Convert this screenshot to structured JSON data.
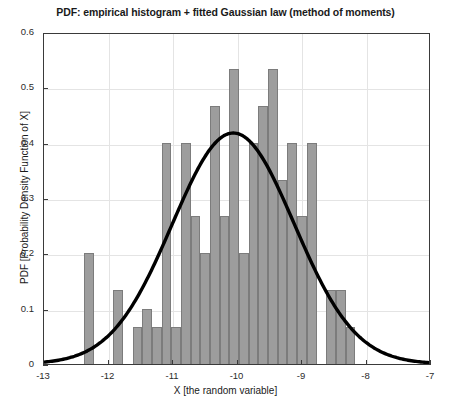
{
  "chart_data": {
    "type": "bar",
    "title": "PDF: empirical histogram + fitted Gaussian law (method of moments)",
    "xlabel": "X [the random variable]",
    "ylabel": "PDF [Probability Density Function of X]",
    "xlim": [
      -13,
      -7
    ],
    "ylim": [
      0,
      0.6
    ],
    "xticks": [
      -13,
      -12,
      -11,
      -10,
      -9,
      -8,
      -7
    ],
    "xticklabels": [
      "-13",
      "-12",
      "-11",
      "-10",
      "-9",
      "-8",
      "-7"
    ],
    "yticks": [
      0,
      0.1,
      0.2,
      0.3,
      0.4,
      0.5,
      0.6
    ],
    "yticklabels": [
      "0",
      "0.1",
      "0.2",
      "0.3",
      "0.4",
      "0.5",
      "0.6"
    ],
    "grid": true,
    "legend": null,
    "bar_color": "#9d9d9d",
    "bar_edge_color": "#7c7c7c",
    "curve_color": "#000000",
    "bin_width": 0.15,
    "bins": [
      {
        "center": -12.3,
        "value": 0.2
      },
      {
        "center": -11.85,
        "value": 0.133
      },
      {
        "center": -11.55,
        "value": 0.067
      },
      {
        "center": -11.4,
        "value": 0.1
      },
      {
        "center": -11.25,
        "value": 0.067
      },
      {
        "center": -11.1,
        "value": 0.4
      },
      {
        "center": -10.95,
        "value": 0.067
      },
      {
        "center": -10.8,
        "value": 0.4
      },
      {
        "center": -10.65,
        "value": 0.267
      },
      {
        "center": -10.5,
        "value": 0.2
      },
      {
        "center": -10.35,
        "value": 0.467
      },
      {
        "center": -10.2,
        "value": 0.267
      },
      {
        "center": -10.05,
        "value": 0.533
      },
      {
        "center": -9.9,
        "value": 0.2
      },
      {
        "center": -9.75,
        "value": 0.4
      },
      {
        "center": -9.6,
        "value": 0.467
      },
      {
        "center": -9.45,
        "value": 0.533
      },
      {
        "center": -9.3,
        "value": 0.333
      },
      {
        "center": -9.15,
        "value": 0.4
      },
      {
        "center": -9.0,
        "value": 0.267
      },
      {
        "center": -8.85,
        "value": 0.4
      },
      {
        "center": -8.55,
        "value": 0.133
      },
      {
        "center": -8.4,
        "value": 0.133
      },
      {
        "center": -8.25,
        "value": 0.067
      }
    ],
    "fitted_curve": {
      "name": "fitted Gaussian law (method of moments)",
      "distribution": "normal",
      "mu": -10.05,
      "sigma": 0.95,
      "peak_value": 0.42
    }
  }
}
